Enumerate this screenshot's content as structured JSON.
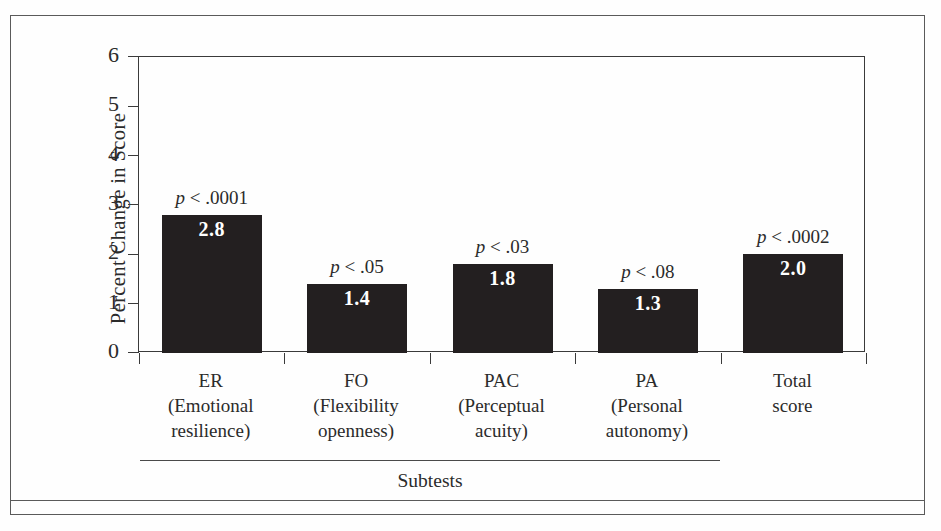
{
  "chart_data": {
    "type": "bar",
    "title": "",
    "xlabel": "Subtests",
    "ylabel": "Percent Change in Score",
    "ylim": [
      0,
      6
    ],
    "yticks": [
      "0",
      "1",
      "2",
      "3",
      "4",
      "5",
      "6"
    ],
    "grid": false,
    "legend": "none",
    "categories": [
      "ER (Emotional resilience)",
      "FO (Flexibility openness)",
      "PAC (Perceptual acuity)",
      "PA (Personal autonomy)",
      "Total score"
    ],
    "values": [
      2.8,
      1.4,
      1.8,
      1.3,
      2.0
    ],
    "value_labels": [
      "2.8",
      "1.4",
      "1.8",
      "1.3",
      "2.0"
    ],
    "annotations": [
      "p < .0001",
      "p < .05",
      "p < .03",
      "p < .08",
      "p < .0002"
    ],
    "bar_color": "#231f20",
    "value_label_color": "#ffffff"
  },
  "axis": {
    "y_title": "Percent Change in Score",
    "ticks": [
      {
        "label": "6",
        "value": 6
      },
      {
        "label": "5",
        "value": 5
      },
      {
        "label": "4",
        "value": 4
      },
      {
        "label": "3",
        "value": 3
      },
      {
        "label": "2",
        "value": 2
      },
      {
        "label": "1",
        "value": 1
      },
      {
        "label": "0",
        "value": 0
      }
    ]
  },
  "bars": [
    {
      "abbr": "ER",
      "full_line1": "(Emotional",
      "full_line2": "resilience)",
      "value_label": "2.8",
      "p_label_prefix": "p",
      "p_label_rest": " < .0001"
    },
    {
      "abbr": "FO",
      "full_line1": "(Flexibility",
      "full_line2": "openness)",
      "value_label": "1.4",
      "p_label_prefix": "p",
      "p_label_rest": " < .05"
    },
    {
      "abbr": "PAC",
      "full_line1": "(Perceptual",
      "full_line2": "acuity)",
      "value_label": "1.8",
      "p_label_prefix": "p",
      "p_label_rest": " < .03"
    },
    {
      "abbr": "PA",
      "full_line1": "(Personal",
      "full_line2": "autonomy)",
      "value_label": "1.3",
      "p_label_prefix": "p",
      "p_label_rest": " < .08"
    },
    {
      "abbr": "Total",
      "full_line1": "score",
      "full_line2": "",
      "value_label": "2.0",
      "p_label_prefix": "p",
      "p_label_rest": " < .0002"
    }
  ],
  "footer": {
    "subtests_label": "Subtests"
  }
}
